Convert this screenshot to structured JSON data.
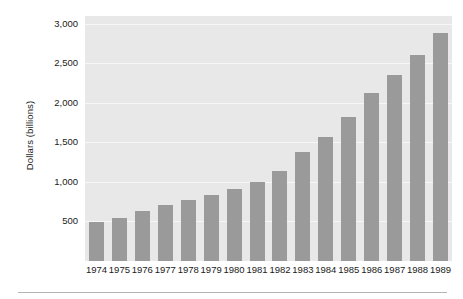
{
  "chart_data": {
    "type": "bar",
    "title": "",
    "subtitle": "",
    "xlabel": "",
    "ylabel": "Dollars (billions)",
    "categories": [
      "1974",
      "1975",
      "1976",
      "1977",
      "1978",
      "1979",
      "1980",
      "1981",
      "1982",
      "1983",
      "1984",
      "1985",
      "1986",
      "1987",
      "1988",
      "1989"
    ],
    "values": [
      490,
      545,
      630,
      705,
      775,
      830,
      910,
      995,
      1140,
      1380,
      1570,
      1820,
      2120,
      2350,
      2610,
      2880
    ],
    "series": [
      {
        "name": "",
        "values": [
          490,
          545,
          630,
          705,
          775,
          830,
          910,
          995,
          1140,
          1380,
          1570,
          1820,
          2120,
          2350,
          2610,
          2880
        ]
      }
    ],
    "ylim": [
      0,
      3100
    ],
    "yticks": [
      500,
      1000,
      1500,
      2000,
      2500,
      3000
    ],
    "ytick_labels": [
      "500",
      "1,000",
      "1,500",
      "2,000",
      "2,500",
      "3,000"
    ],
    "grid": true,
    "grid_axis": "y",
    "legend": false,
    "legend_position": "none",
    "annotations": [],
    "colors": {
      "bar": "#9a9a9a",
      "plot_background": "#e8e8e8",
      "gridline": "#f7f7f7",
      "text": "#1a1a1a",
      "rule": "#b4b4b4",
      "page_background": "#ffffff"
    }
  }
}
